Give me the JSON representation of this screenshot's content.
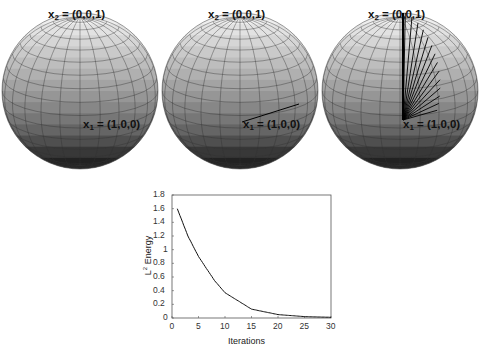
{
  "figure": {
    "spheres": [
      {
        "id": "sphere-initial",
        "top_label": {
          "var": "x",
          "sub": "2",
          "value": "= (0,0,1)"
        },
        "bottom_label": {
          "var": "x",
          "sub": "1",
          "value": "= (1,0,0)"
        },
        "geodesic_lines": 0
      },
      {
        "id": "sphere-first-step",
        "top_label": {
          "var": "x",
          "sub": "2",
          "value": "= (0,0,1)"
        },
        "bottom_label": {
          "var": "x",
          "sub": "1",
          "value": "= (1,0,0)"
        },
        "geodesic_lines": 1
      },
      {
        "id": "sphere-iterations",
        "top_label": {
          "var": "x",
          "sub": "2",
          "value": "= (0,0,1)"
        },
        "bottom_label": {
          "var": "x",
          "sub": "1",
          "value": "= (1,0,0)"
        },
        "geodesic_lines": 14
      }
    ]
  },
  "chart_data": {
    "type": "line",
    "title": "",
    "xlabel": "Iterations",
    "ylabel": "L2 Energy",
    "ylabel_main": "L",
    "ylabel_sup": "2",
    "ylabel_rest": " Energy",
    "xlim": [
      0,
      30
    ],
    "ylim": [
      0,
      1.8
    ],
    "xticks": [
      "0",
      "5",
      "10",
      "15",
      "20",
      "25",
      "30"
    ],
    "yticks": [
      "0",
      "0.2",
      "0.4",
      "0.6",
      "0.8",
      "1",
      "1.2",
      "1.4",
      "1.6",
      "1.8"
    ],
    "grid": false,
    "series": [
      {
        "name": "L2 Energy",
        "x": [
          1,
          3,
          5,
          8,
          10,
          15,
          20,
          25,
          30
        ],
        "values": [
          1.6,
          1.2,
          0.9,
          0.55,
          0.37,
          0.13,
          0.05,
          0.02,
          0.01
        ]
      }
    ]
  }
}
